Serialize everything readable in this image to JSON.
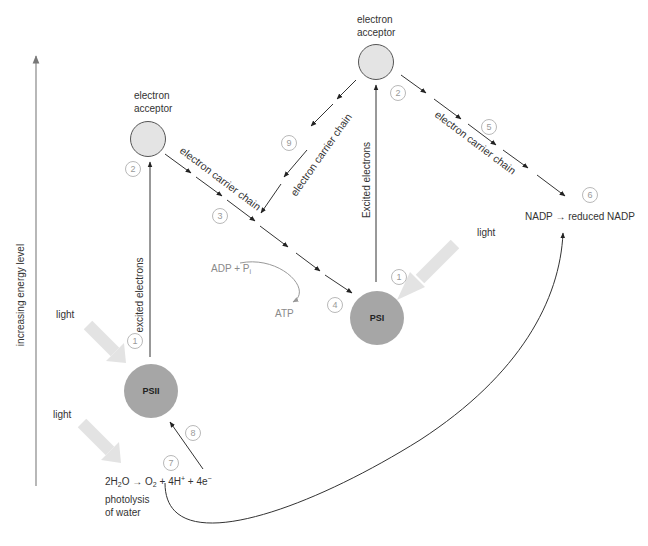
{
  "diagram": {
    "type": "Z-scheme of light-dependent reactions",
    "axis": {
      "label": "increasing energy level"
    },
    "nodes": {
      "psii": {
        "label": "PSII",
        "color": "#a6a6a6"
      },
      "psi": {
        "label": "PSI",
        "color": "#a6a6a6"
      },
      "acceptor_left": {
        "label_line1": "electron",
        "label_line2": "acceptor",
        "color": "#e4e4e4"
      },
      "acceptor_right": {
        "label_line1": "electron",
        "label_line2": "acceptor",
        "color": "#e4e4e4"
      }
    },
    "labels": {
      "light_psii": "light",
      "light_water": "light",
      "light_psi": "light",
      "excited_left": "excited electrons",
      "excited_right": "Excited electrons",
      "chain_left": "electron carrier chain",
      "chain_middle": "electron carrier chain",
      "chain_right": "electron carrier chain",
      "adp": "ADP + P",
      "adp_sub": "i",
      "atp": "ATP",
      "nadp": "NADP → reduced NADP",
      "water_eq_a": "2H",
      "water_eq_b": "2",
      "water_eq_c": "O → O",
      "water_eq_d": "2",
      "water_eq_e": " + 4H",
      "water_eq_f": "+",
      "water_eq_g": " + 4e",
      "water_eq_h": "−",
      "photolysis_1": "photolysis",
      "photolysis_2": "of water"
    },
    "step_numbers": {
      "psii_1": "1",
      "acc_left_2": "2",
      "chain_3": "3",
      "psi_4": "4",
      "psi_1": "1",
      "acc_right_2": "2",
      "chain_5": "5",
      "nadp_6": "6",
      "water_7": "7",
      "return_8": "8",
      "cyclic_9": "9"
    },
    "colors": {
      "line": "#333333",
      "light_arrow": "#e3e3e3",
      "number_circle": "#b0b0b0"
    }
  }
}
